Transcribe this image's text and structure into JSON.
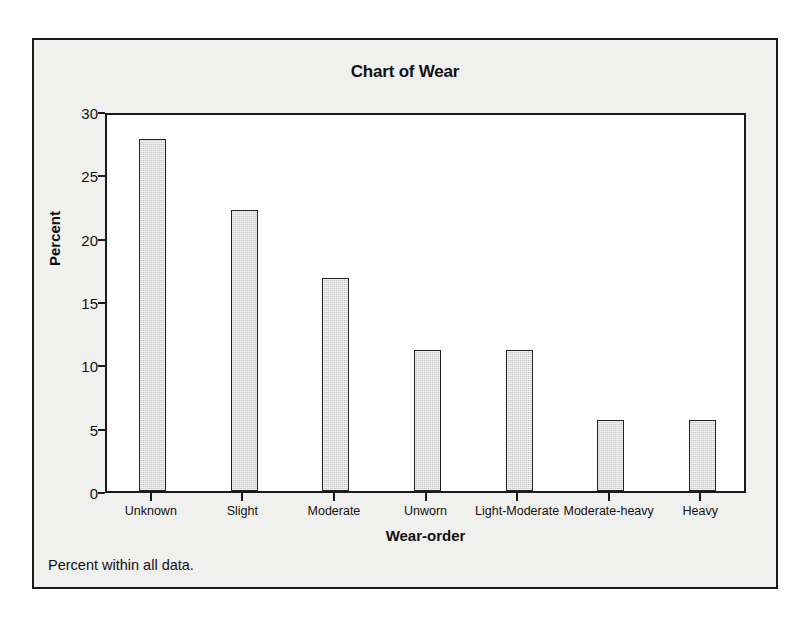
{
  "chart_data": {
    "type": "bar",
    "title": "Chart of Wear",
    "xlabel": "Wear-order",
    "ylabel": "Percent",
    "categories": [
      "Unknown",
      "Slight",
      "Moderate",
      "Unworn",
      "Light-Moderate",
      "Moderate-heavy",
      "Heavy"
    ],
    "values": [
      27.8,
      22.2,
      16.8,
      11.1,
      11.1,
      5.6,
      5.6
    ],
    "ylim": [
      0,
      30
    ],
    "yticks": [
      0,
      5,
      10,
      15,
      20,
      25,
      30
    ],
    "ytick_labels": [
      "0",
      "5",
      "10",
      "15",
      "20",
      "25",
      "30"
    ],
    "grid": false,
    "legend": "none",
    "footnote": "Percent within all data.",
    "bar_fill_color": "#cfcfcf",
    "bar_edge_color": "#222222",
    "figure_background": "#f0f0ee",
    "plot_background": "#ffffff"
  }
}
